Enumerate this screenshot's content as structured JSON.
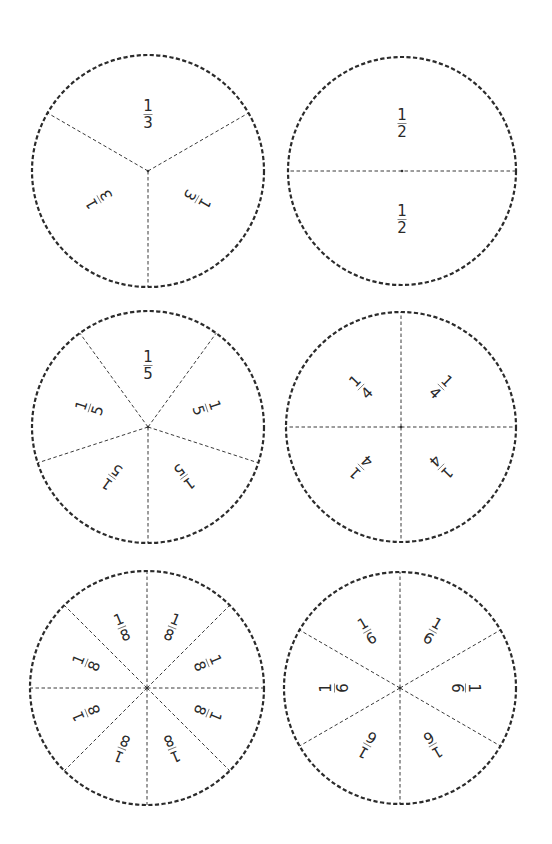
{
  "page": {
    "background": "#ffffff",
    "line_color": "#2b2b2b"
  },
  "circles": [
    {
      "id": "thirds",
      "name": "fraction-circle-thirds",
      "cx": 148,
      "cy": 171,
      "r": 116,
      "divisions": 3,
      "divider_start_deg": 60,
      "label_radius": 57,
      "upright_labels": false,
      "font_size": 15,
      "labels": [
        {
          "numerator": "1",
          "denominator": "3"
        },
        {
          "numerator": "1",
          "denominator": "3"
        },
        {
          "numerator": "1",
          "denominator": "3"
        }
      ]
    },
    {
      "id": "halves",
      "name": "fraction-circle-halves",
      "cx": 402,
      "cy": 171,
      "r": 114,
      "divisions": 2,
      "divider_start_deg": 90,
      "label_radius": 48,
      "upright_labels": true,
      "font_size": 15,
      "labels": [
        {
          "numerator": "1",
          "denominator": "2"
        },
        {
          "numerator": "1",
          "denominator": "2"
        }
      ]
    },
    {
      "id": "fifths",
      "name": "fraction-circle-fifths",
      "cx": 148,
      "cy": 427,
      "r": 116,
      "divisions": 5,
      "divider_start_deg": 36,
      "label_radius": 62,
      "upright_labels": false,
      "font_size": 15,
      "labels": [
        {
          "numerator": "1",
          "denominator": "5"
        },
        {
          "numerator": "1",
          "denominator": "5"
        },
        {
          "numerator": "1",
          "denominator": "5"
        },
        {
          "numerator": "1",
          "denominator": "5"
        },
        {
          "numerator": "1",
          "denominator": "5"
        }
      ]
    },
    {
      "id": "quarters",
      "name": "fraction-circle-quarters",
      "cx": 401,
      "cy": 427,
      "r": 115,
      "divisions": 4,
      "divider_start_deg": 0,
      "label_radius": 57,
      "upright_labels": false,
      "font_size": 15,
      "labels": [
        {
          "numerator": "1",
          "denominator": "4"
        },
        {
          "numerator": "1",
          "denominator": "4"
        },
        {
          "numerator": "1",
          "denominator": "4"
        },
        {
          "numerator": "1",
          "denominator": "4"
        }
      ]
    },
    {
      "id": "eighths",
      "name": "fraction-circle-eighths",
      "cx": 147,
      "cy": 688,
      "r": 117,
      "divisions": 8,
      "divider_start_deg": 0,
      "label_radius": 66,
      "upright_labels": false,
      "font_size": 15,
      "labels": [
        {
          "numerator": "1",
          "denominator": "8"
        },
        {
          "numerator": "1",
          "denominator": "8"
        },
        {
          "numerator": "1",
          "denominator": "8"
        },
        {
          "numerator": "1",
          "denominator": "8"
        },
        {
          "numerator": "1",
          "denominator": "8"
        },
        {
          "numerator": "1",
          "denominator": "8"
        },
        {
          "numerator": "1",
          "denominator": "8"
        },
        {
          "numerator": "1",
          "denominator": "8"
        }
      ]
    },
    {
      "id": "sixths",
      "name": "fraction-circle-sixths",
      "cx": 400,
      "cy": 688,
      "r": 116,
      "divisions": 6,
      "divider_start_deg": 0,
      "label_radius": 66,
      "upright_labels": false,
      "font_size": 15,
      "labels": [
        {
          "numerator": "1",
          "denominator": "6"
        },
        {
          "numerator": "1",
          "denominator": "6"
        },
        {
          "numerator": "1",
          "denominator": "6"
        },
        {
          "numerator": "1",
          "denominator": "6"
        },
        {
          "numerator": "1",
          "denominator": "6"
        },
        {
          "numerator": "1",
          "denominator": "6"
        }
      ]
    }
  ]
}
